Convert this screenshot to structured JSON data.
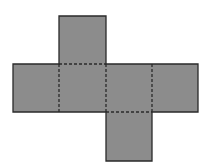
{
  "diagram": {
    "type": "cube-net",
    "fill_color": "#8c8c8c",
    "stroke_color": "#2a2a2a",
    "faces": [
      {
        "name": "top",
        "x": 59,
        "y": 16,
        "w": 47,
        "h": 48
      },
      {
        "name": "left",
        "x": 13,
        "y": 64,
        "w": 46,
        "h": 48
      },
      {
        "name": "center-left",
        "x": 59,
        "y": 64,
        "w": 47,
        "h": 48
      },
      {
        "name": "center-right",
        "x": 106,
        "y": 64,
        "w": 46,
        "h": 48
      },
      {
        "name": "right",
        "x": 152,
        "y": 64,
        "w": 46,
        "h": 48
      },
      {
        "name": "bottom",
        "x": 106,
        "y": 112,
        "w": 46,
        "h": 49
      }
    ],
    "fold_lines_style": "dashed",
    "cut_lines_style": "solid"
  }
}
